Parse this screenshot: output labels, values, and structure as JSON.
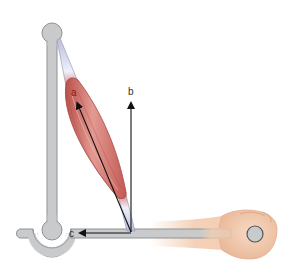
{
  "diagram": {
    "labels": {
      "a": "a",
      "b": "b",
      "c": "c"
    },
    "components": {
      "muscle": "muscle-belly",
      "upper_arm_bar": "humerus-bar",
      "forearm_bar": "forearm-bar",
      "joint": "elbow-joint",
      "hand": "clenched-fist"
    },
    "colors": {
      "bar_fill": "#c9cacc",
      "bar_stroke": "#8f9194",
      "muscle": "#c9625c",
      "muscle_highlight": "#e8a19a",
      "tendon": "#dfe3f3",
      "arrow": "#111111",
      "label_a": "#8b1a1a",
      "label_bc": "#333333",
      "skin": "#f3cdb1"
    }
  }
}
